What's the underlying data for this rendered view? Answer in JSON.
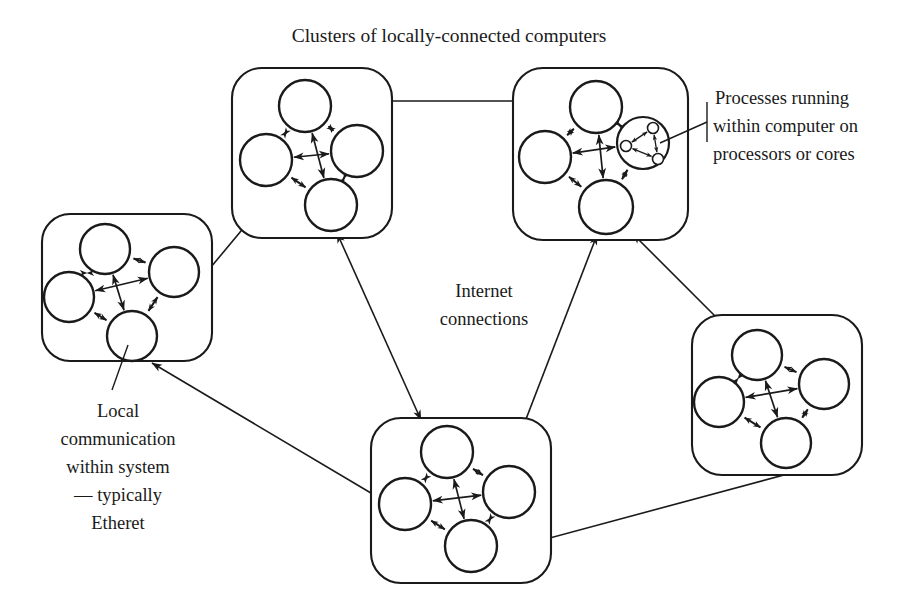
{
  "figure": {
    "title": "Clusters of locally-connected computers",
    "background_color": "#ffffff",
    "ink_color": "#1a1a1a"
  },
  "labels": {
    "title": "Clusters of locally-connected computers",
    "center_line_1": "Internet",
    "center_line_2": "connections",
    "processes_line_1": "Processes running",
    "processes_line_2": "within computer on",
    "processes_line_3": "processors or cores",
    "local_line_1": "Local",
    "local_line_2": "communication",
    "local_line_3": "within system",
    "local_line_4": "— typically",
    "local_line_5": "Etheret"
  },
  "clusters": [
    {
      "id": "cluster-top-left",
      "name": "top-left cluster",
      "box": {
        "x": 232,
        "y": 68,
        "w": 160,
        "h": 170,
        "r": 30
      },
      "nodes": [
        {
          "id": "tl-n",
          "cx": 305,
          "cy": 106,
          "r": 26
        },
        {
          "id": "tl-w",
          "cx": 266,
          "cy": 160,
          "r": 26
        },
        {
          "id": "tl-e",
          "cx": 357,
          "cy": 151,
          "r": 26
        },
        {
          "id": "tl-s",
          "cx": 331,
          "cy": 205,
          "r": 26
        }
      ],
      "has_processes": false
    },
    {
      "id": "cluster-top-right",
      "name": "top-right cluster",
      "box": {
        "x": 513,
        "y": 68,
        "w": 175,
        "h": 172,
        "r": 30
      },
      "nodes": [
        {
          "id": "tr-n",
          "cx": 596,
          "cy": 107,
          "r": 26
        },
        {
          "id": "tr-w",
          "cx": 545,
          "cy": 157,
          "r": 26
        },
        {
          "id": "tr-e",
          "cx": 643,
          "cy": 143,
          "r": 26
        },
        {
          "id": "tr-s",
          "cx": 606,
          "cy": 207,
          "r": 27
        }
      ],
      "has_processes": true,
      "processes_host": "tr-e",
      "process_dots": [
        {
          "cx": 653,
          "cy": 128,
          "r": 5.5
        },
        {
          "cx": 626,
          "cy": 146,
          "r": 5.5
        },
        {
          "cx": 658,
          "cy": 159,
          "r": 5.5
        }
      ]
    },
    {
      "id": "cluster-left",
      "name": "left cluster",
      "box": {
        "x": 42,
        "y": 214,
        "w": 170,
        "h": 147,
        "r": 28
      },
      "nodes": [
        {
          "id": "l-n",
          "cx": 105,
          "cy": 249,
          "r": 25
        },
        {
          "id": "l-w",
          "cx": 69,
          "cy": 297,
          "r": 25
        },
        {
          "id": "l-e",
          "cx": 174,
          "cy": 272,
          "r": 25
        },
        {
          "id": "l-s",
          "cx": 132,
          "cy": 336,
          "r": 25
        }
      ],
      "has_processes": false
    },
    {
      "id": "cluster-bottom",
      "name": "bottom cluster",
      "box": {
        "x": 371,
        "y": 418,
        "w": 180,
        "h": 165,
        "r": 30
      },
      "nodes": [
        {
          "id": "b-n",
          "cx": 447,
          "cy": 452,
          "r": 26
        },
        {
          "id": "b-w",
          "cx": 405,
          "cy": 504,
          "r": 26
        },
        {
          "id": "b-e",
          "cx": 509,
          "cy": 492,
          "r": 26
        },
        {
          "id": "b-s",
          "cx": 471,
          "cy": 546,
          "r": 26
        }
      ],
      "has_processes": false
    },
    {
      "id": "cluster-bottom-right",
      "name": "bottom-right cluster",
      "box": {
        "x": 692,
        "y": 315,
        "w": 170,
        "h": 160,
        "r": 30
      },
      "nodes": [
        {
          "id": "br-n",
          "cx": 757,
          "cy": 355,
          "r": 25
        },
        {
          "id": "br-w",
          "cx": 719,
          "cy": 402,
          "r": 25
        },
        {
          "id": "br-e",
          "cx": 824,
          "cy": 384,
          "r": 25
        },
        {
          "id": "br-s",
          "cx": 786,
          "cy": 443,
          "r": 25
        }
      ],
      "has_processes": false
    }
  ],
  "internet_links": [
    {
      "id": "link-tl-tr",
      "from": "cluster-top-left",
      "to": "cluster-top-right",
      "x1": 334,
      "y1": 101,
      "x2": 566,
      "y2": 101,
      "arrows": "both"
    },
    {
      "id": "link-left-tl",
      "from": "cluster-left",
      "to": "cluster-top-left",
      "x1": 191,
      "y1": 291,
      "x2": 251,
      "y2": 219,
      "arrows": "both"
    },
    {
      "id": "link-tl-bottom",
      "from": "cluster-top-left",
      "to": "cluster-bottom",
      "x1": 337,
      "y1": 233,
      "x2": 421,
      "y2": 420,
      "arrows": "both"
    },
    {
      "id": "link-left-bottom",
      "from": "cluster-left",
      "to": "cluster-bottom",
      "x1": 152,
      "y1": 363,
      "x2": 381,
      "y2": 499,
      "arrows": "both"
    },
    {
      "id": "link-bottom-tr",
      "from": "cluster-bottom",
      "to": "cluster-top-right",
      "x1": 506,
      "y1": 471,
      "x2": 597,
      "y2": 235,
      "arrows": "both"
    },
    {
      "id": "link-tr-br",
      "from": "cluster-top-right",
      "to": "cluster-bottom-right",
      "x1": 633,
      "y1": 234,
      "x2": 740,
      "y2": 341,
      "arrows": "both"
    },
    {
      "id": "link-bottom-br",
      "from": "cluster-bottom",
      "to": "cluster-bottom-right",
      "x1": 494,
      "y1": 553,
      "x2": 821,
      "y2": 465,
      "arrows": "both"
    }
  ],
  "leaders": [
    {
      "id": "leader-processes",
      "name": "processes-leader-line",
      "x1": 707,
      "y1": 122,
      "x2": 660,
      "y2": 143
    },
    {
      "id": "leader-local",
      "name": "local-communication-leader-line",
      "x1": 112,
      "y1": 390,
      "x2": 128,
      "y2": 345
    }
  ],
  "text_positions": {
    "title": {
      "x": 449,
      "y": 42
    },
    "center": {
      "x": 484,
      "y": 296
    },
    "processes": {
      "x": 713,
      "y": 103
    },
    "local": {
      "x": 118,
      "y": 415
    }
  }
}
